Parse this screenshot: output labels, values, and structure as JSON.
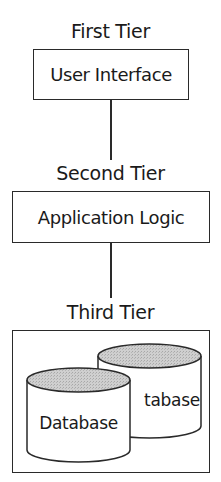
{
  "diagram": {
    "type": "three-tier-architecture",
    "tiers": [
      {
        "label": "First Tier",
        "component": "User Interface"
      },
      {
        "label": "Second Tier",
        "component": "Application Logic"
      },
      {
        "label": "Third Tier",
        "components": [
          {
            "label": "Database",
            "shape": "cylinder",
            "position": "back",
            "visible_text": "tabase"
          },
          {
            "label": "Database",
            "shape": "cylinder",
            "position": "front"
          }
        ]
      }
    ],
    "connections": [
      {
        "from": "User Interface",
        "to": "Application Logic"
      },
      {
        "from": "Application Logic",
        "to": "Third Tier"
      }
    ],
    "colors": {
      "stroke": "#2a2a2a",
      "cylinder_top_fill": "#c8c8c8",
      "background": "#ffffff"
    }
  }
}
